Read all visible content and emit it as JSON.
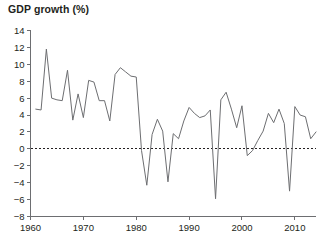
{
  "chart": {
    "title": "GDP growth (%)",
    "axis_color": "#6d6e71",
    "line_color": "#6d6e71",
    "zero_line_color": "#231f20"
  },
  "chart_data": {
    "type": "line",
    "title": "GDP growth (%)",
    "xlabel": "",
    "ylabel": "GDP growth (%)",
    "xlim": [
      1960,
      2014
    ],
    "ylim": [
      -8,
      14
    ],
    "grid": false,
    "legend": "none",
    "xticks": [
      1960,
      1970,
      1980,
      1990,
      2000,
      2010
    ],
    "yticks": [
      -8,
      -6,
      -4,
      -2,
      0,
      2,
      4,
      6,
      8,
      10,
      12,
      14
    ],
    "zero_reference_line": 0,
    "x": [
      1961,
      1962,
      1963,
      1964,
      1965,
      1966,
      1967,
      1968,
      1969,
      1970,
      1971,
      1972,
      1973,
      1974,
      1975,
      1976,
      1977,
      1978,
      1979,
      1980,
      1981,
      1982,
      1983,
      1984,
      1985,
      1986,
      1987,
      1988,
      1989,
      1990,
      1991,
      1992,
      1993,
      1994,
      1995,
      1996,
      1997,
      1998,
      1999,
      2000,
      2001,
      2002,
      2003,
      2004,
      2005,
      2006,
      2007,
      2008,
      2009,
      2010,
      2011,
      2012,
      2013,
      2014
    ],
    "values": [
      4.7,
      4.6,
      11.8,
      6.0,
      5.8,
      5.7,
      9.3,
      3.4,
      6.5,
      3.7,
      8.1,
      7.9,
      5.7,
      5.7,
      3.3,
      8.8,
      9.6,
      9.1,
      8.6,
      8.5,
      -0.2,
      -4.3,
      1.7,
      3.5,
      2.1,
      -3.9,
      1.8,
      1.2,
      3.3,
      4.9,
      4.2,
      3.7,
      3.9,
      4.6,
      -5.9,
      5.8,
      6.7,
      4.7,
      2.5,
      5.1,
      -0.8,
      -0.2,
      1.0,
      2.1,
      4.2,
      3.1,
      4.7,
      3.0,
      -5.0,
      5.0,
      4.0,
      3.8,
      1.2,
      2.0
    ],
    "units": "percent",
    "series_name": "GDP growth"
  }
}
